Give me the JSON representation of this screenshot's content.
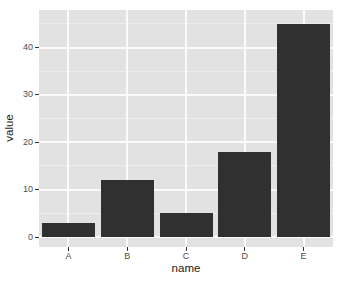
{
  "chart_data": {
    "type": "bar",
    "title": "",
    "xlabel": "name",
    "ylabel": "value",
    "categories": [
      "A",
      "B",
      "C",
      "D",
      "E"
    ],
    "values": [
      3,
      12,
      5,
      18,
      45
    ],
    "yticks": [
      0,
      10,
      20,
      30,
      40
    ],
    "yticks_minor": [
      5,
      15,
      25,
      35,
      45
    ],
    "ylim": [
      0,
      45
    ],
    "grid": "major+minor",
    "legend": "none",
    "colors": {
      "bar": "#303030",
      "panel_background": "#e2e2e2",
      "grid_major": "#fbfbfb",
      "grid_minor": "#eeeeee",
      "tick_mark": "#333333",
      "tick_label": "#4d4d4d",
      "axis_title": "#1a1a1a",
      "figure_background": "#ffffff"
    }
  }
}
